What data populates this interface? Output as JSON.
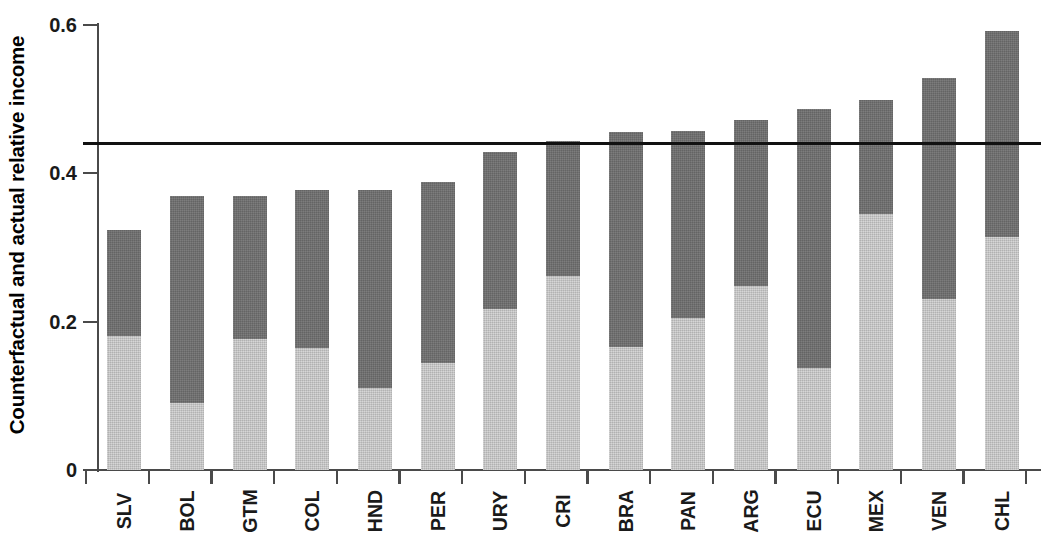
{
  "chart_data": {
    "type": "bar",
    "stacked": true,
    "title": "",
    "xlabel": "",
    "ylabel": "Counterfactual and actual relative income",
    "ylim": [
      0,
      0.62
    ],
    "yticks": [
      0,
      0.2,
      0.4,
      0.6
    ],
    "ytick_labels": [
      "0",
      "0.2",
      "0.4",
      "0.6"
    ],
    "grid": false,
    "legend": "none",
    "categories": [
      "SLV",
      "BOL",
      "GTM",
      "COL",
      "HND",
      "PER",
      "URY",
      "CRI",
      "BRA",
      "PAN",
      "ARG",
      "ECU",
      "MEX",
      "VEN",
      "CHL"
    ],
    "series": [
      {
        "name": "actual relative income",
        "color": "#c6c6c6",
        "values": [
          0.181,
          0.09,
          0.177,
          0.165,
          0.11,
          0.144,
          0.217,
          0.261,
          0.166,
          0.205,
          0.248,
          0.137,
          0.345,
          0.231,
          0.314
        ]
      },
      {
        "name": "counterfactual relative income",
        "color": "#6e6e6e",
        "values": [
          0.323,
          0.37,
          0.369,
          0.378,
          0.378,
          0.388,
          0.429,
          0.444,
          0.456,
          0.457,
          0.472,
          0.487,
          0.499,
          0.528,
          0.592
        ],
        "note": "totals; dark segment spans from the light-segment top to this total"
      }
    ],
    "reference_line": {
      "value": 0.44,
      "color": "#111111"
    }
  },
  "colors": {
    "dark_segment": "#6e6e6e",
    "light_segment": "#c6c6c6",
    "axis": "#4a4a4a",
    "reference_line": "#111111",
    "text": "#1a1a1a",
    "background": "#ffffff"
  }
}
